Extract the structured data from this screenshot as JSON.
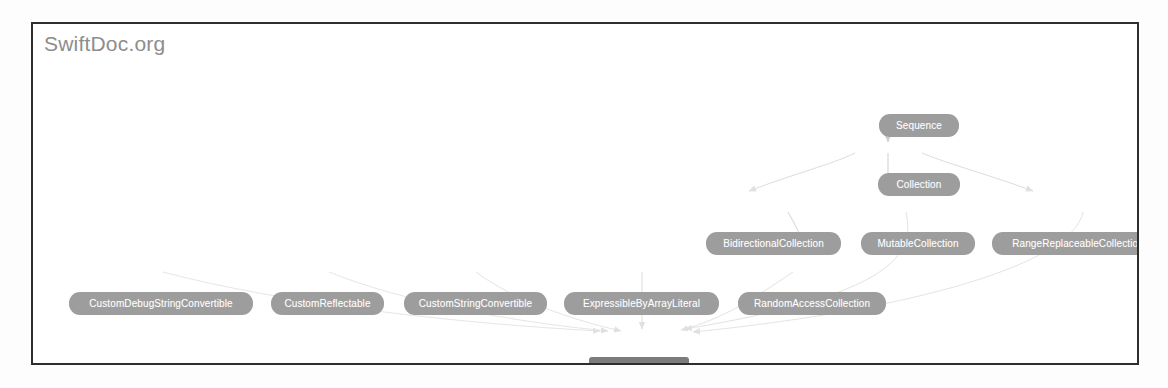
{
  "panel": {
    "title": "SwiftDoc.org",
    "border_color": "#2e2e2e",
    "background": "#ffffff"
  },
  "diagram": {
    "type": "inheritance-graph",
    "node_fill": "#9d9d9d",
    "target_node_fill": "#7c7c7c",
    "node_text_color": "#ffffff",
    "edge_color": "#d8d8d8",
    "nodes": [
      {
        "id": "sequence",
        "label": "Sequence",
        "x": 846,
        "y": 90,
        "w": 80,
        "kind": "protocol"
      },
      {
        "id": "collection",
        "label": "Collection",
        "x": 845,
        "y": 149,
        "w": 82,
        "kind": "protocol"
      },
      {
        "id": "bidirectional-collection",
        "label": "BidirectionalCollection",
        "x": 673,
        "y": 208,
        "w": 135,
        "kind": "protocol"
      },
      {
        "id": "mutable-collection",
        "label": "MutableCollection",
        "x": 828,
        "y": 208,
        "w": 114,
        "kind": "protocol"
      },
      {
        "id": "range-replaceable-collection",
        "label": "RangeReplaceableCollection",
        "x": 959,
        "y": 208,
        "w": 172,
        "kind": "protocol"
      },
      {
        "id": "custom-debug-string",
        "label": "CustomDebugStringConvertible",
        "x": 36,
        "y": 268,
        "w": 184,
        "kind": "protocol"
      },
      {
        "id": "custom-reflectable",
        "label": "CustomReflectable",
        "x": 238,
        "y": 268,
        "w": 113,
        "kind": "protocol"
      },
      {
        "id": "custom-string-convertible",
        "label": "CustomStringConvertible",
        "x": 371,
        "y": 268,
        "w": 143,
        "kind": "protocol"
      },
      {
        "id": "expressible-by-array-literal",
        "label": "ExpressibleByArrayLiteral",
        "x": 531,
        "y": 268,
        "w": 155,
        "kind": "protocol"
      },
      {
        "id": "random-access-collection",
        "label": "RandomAccessCollection",
        "x": 705,
        "y": 268,
        "w": 148,
        "kind": "protocol"
      },
      {
        "id": "array-element",
        "label": "Array<Element>",
        "x": 556,
        "y": 333,
        "w": 100,
        "kind": "target"
      }
    ],
    "edges": [
      {
        "from": "sequence",
        "to": "collection"
      },
      {
        "from": "collection",
        "to": "bidirectional-collection"
      },
      {
        "from": "collection",
        "to": "mutable-collection"
      },
      {
        "from": "collection",
        "to": "range-replaceable-collection"
      },
      {
        "from": "bidirectional-collection",
        "to": "random-access-collection"
      },
      {
        "from": "mutable-collection",
        "to": "array-element"
      },
      {
        "from": "range-replaceable-collection",
        "to": "array-element"
      },
      {
        "from": "random-access-collection",
        "to": "array-element"
      },
      {
        "from": "custom-debug-string",
        "to": "array-element"
      },
      {
        "from": "custom-reflectable",
        "to": "array-element"
      },
      {
        "from": "custom-string-convertible",
        "to": "array-element"
      },
      {
        "from": "expressible-by-array-literal",
        "to": "array-element"
      }
    ]
  }
}
